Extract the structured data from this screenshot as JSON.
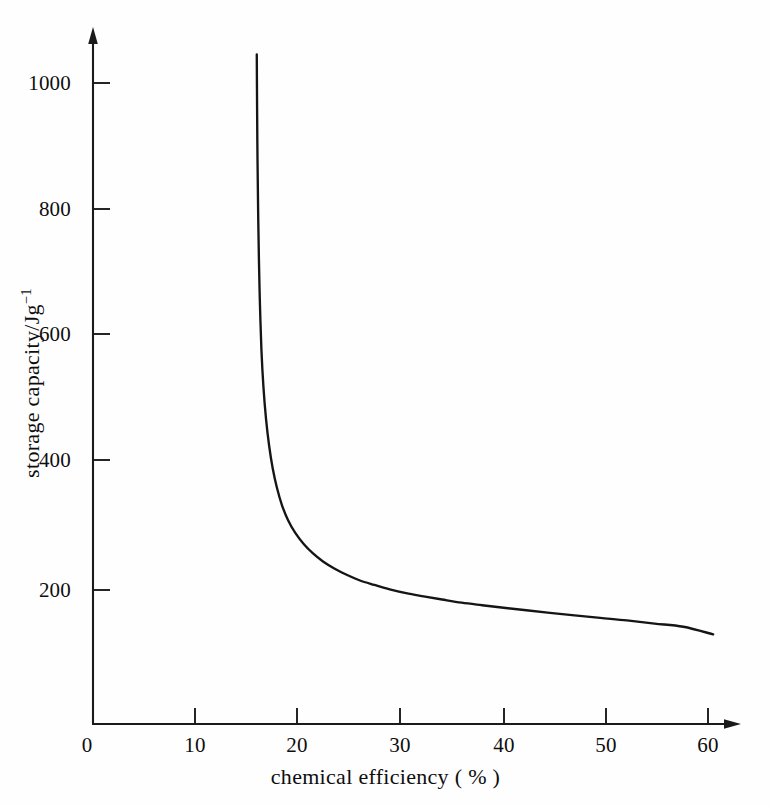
{
  "figure": {
    "background_color": "#fefefe",
    "ink_color": "#141414",
    "axis_color": "#1a1a1a",
    "curve_color": "#151515"
  },
  "axes": {
    "x_axis": {
      "title": "chemical efficiency ( % )",
      "ticks": [
        "0",
        "10",
        "20",
        "30",
        "40",
        "50",
        "60"
      ],
      "tick_values": [
        0,
        10,
        20,
        30,
        40,
        50,
        60
      ],
      "range": [
        0,
        62
      ],
      "arrow": true
    },
    "y_axis": {
      "title_text": "storage capacity/Jg",
      "title_superscript": "−1",
      "ticks": [
        "200",
        "400",
        "600",
        "800",
        "1000"
      ],
      "tick_values": [
        200,
        400,
        600,
        800,
        1000
      ],
      "range": [
        0,
        1120
      ],
      "arrow": true
    }
  },
  "chart_data": {
    "type": "line",
    "title": "",
    "subtitle": "",
    "xlabel": "chemical efficiency ( % )",
    "ylabel": "storage capacity/Jg−1",
    "xlim": [
      0,
      62
    ],
    "ylim": [
      0,
      1120
    ],
    "xticks": [
      0,
      10,
      20,
      30,
      40,
      50,
      60
    ],
    "yticks": [
      200,
      400,
      600,
      800,
      1000
    ],
    "grid": false,
    "legend": false,
    "legend_position": "none",
    "annotations": [],
    "series": [
      {
        "name": "storage capacity",
        "x": [
          16.05,
          16.08,
          16.12,
          16.18,
          16.26,
          16.36,
          16.5,
          16.7,
          16.95,
          17.25,
          17.6,
          18.0,
          18.5,
          19.1,
          19.8,
          20.6,
          21.5,
          22.5,
          23.6,
          24.8,
          26.1,
          27.5,
          29.0,
          30.6,
          32.3,
          34.1,
          36.0,
          38.0,
          40.1,
          42.3,
          44.6,
          47.0,
          49.5,
          52.1,
          54.8,
          57.6,
          60.5
        ],
        "y": [
          1045,
          960,
          880,
          800,
          720,
          650,
          580,
          520,
          470,
          428,
          392,
          362,
          334,
          310,
          290,
          273,
          258,
          245,
          234,
          224,
          215,
          208,
          201,
          195,
          190,
          185,
          180,
          176,
          172,
          168,
          164,
          160,
          156,
          152,
          147,
          142,
          130
        ]
      }
    ]
  }
}
